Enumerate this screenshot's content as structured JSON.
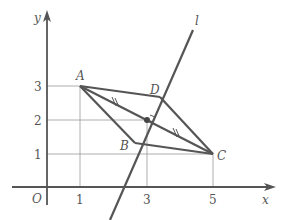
{
  "diagram": {
    "type": "coordinate-geometry",
    "axes": {
      "x_label": "x",
      "y_label": "y",
      "origin_label": "O",
      "x_ticks": [
        "1",
        "3",
        "5"
      ],
      "y_ticks": [
        "1",
        "2",
        "3"
      ]
    },
    "points": {
      "A": {
        "label": "A",
        "x": 1,
        "y": 3
      },
      "B": {
        "label": "B"
      },
      "C": {
        "label": "C",
        "x": 5,
        "y": 1
      },
      "D": {
        "label": "D"
      },
      "M": {
        "x": 3,
        "y": 2
      }
    },
    "line_label": "l",
    "colors": {
      "stroke": "#555555",
      "guide": "#999999",
      "background": "#ffffff"
    }
  }
}
